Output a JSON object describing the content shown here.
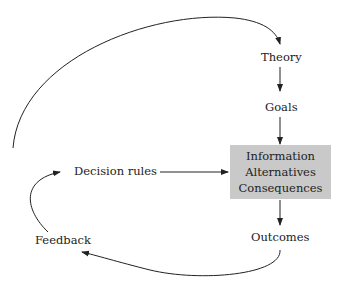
{
  "nodes": {
    "theory": "Theory",
    "goals": "Goals",
    "box": [
      "Information",
      "Alternatives",
      "Consequences"
    ],
    "outcomes": "Outcomes",
    "feedback": "Feedback",
    "decision_rules": "Decision rules"
  },
  "colors": {
    "box_fill": "#c9c9c9",
    "stroke": "#222222"
  }
}
